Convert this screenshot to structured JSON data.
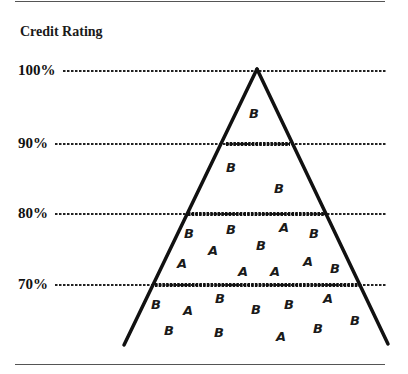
{
  "title": "Credit Rating",
  "levels": [
    {
      "label": "100%",
      "y": 71
    },
    {
      "label": "90%",
      "y": 144
    },
    {
      "label": "80%",
      "y": 214
    },
    {
      "label": "70%",
      "y": 285
    }
  ],
  "colors": {
    "line": "#111111",
    "rule": "#555555",
    "text": "#1a1a1a"
  },
  "bands": [
    {
      "range": "90%-100%",
      "letters": [
        {
          "t": "B",
          "x": 249,
          "y": 118
        }
      ]
    },
    {
      "range": "80%-90%",
      "letters": [
        {
          "t": "B",
          "x": 226,
          "y": 172
        },
        {
          "t": "B",
          "x": 274,
          "y": 193
        }
      ]
    },
    {
      "range": "70%-80%",
      "letters": [
        {
          "t": "B",
          "x": 184,
          "y": 238
        },
        {
          "t": "B",
          "x": 226,
          "y": 234
        },
        {
          "t": "A",
          "x": 279,
          "y": 232
        },
        {
          "t": "B",
          "x": 309,
          "y": 238
        },
        {
          "t": "A",
          "x": 208,
          "y": 255
        },
        {
          "t": "B",
          "x": 256,
          "y": 250
        },
        {
          "t": "A",
          "x": 177,
          "y": 268
        },
        {
          "t": "A",
          "x": 238,
          "y": 276
        },
        {
          "t": "A",
          "x": 270,
          "y": 276
        },
        {
          "t": "A",
          "x": 303,
          "y": 266
        },
        {
          "t": "B",
          "x": 330,
          "y": 273
        }
      ]
    },
    {
      "range": "below 70%",
      "letters": [
        {
          "t": "B",
          "x": 151,
          "y": 309
        },
        {
          "t": "B",
          "x": 215,
          "y": 303
        },
        {
          "t": "A",
          "x": 323,
          "y": 303
        },
        {
          "t": "A",
          "x": 183,
          "y": 315
        },
        {
          "t": "B",
          "x": 251,
          "y": 314
        },
        {
          "t": "B",
          "x": 284,
          "y": 309
        },
        {
          "t": "B",
          "x": 164,
          "y": 335
        },
        {
          "t": "B",
          "x": 214,
          "y": 337
        },
        {
          "t": "A",
          "x": 276,
          "y": 341
        },
        {
          "t": "B",
          "x": 313,
          "y": 333
        },
        {
          "t": "B",
          "x": 350,
          "y": 325
        }
      ]
    }
  ]
}
